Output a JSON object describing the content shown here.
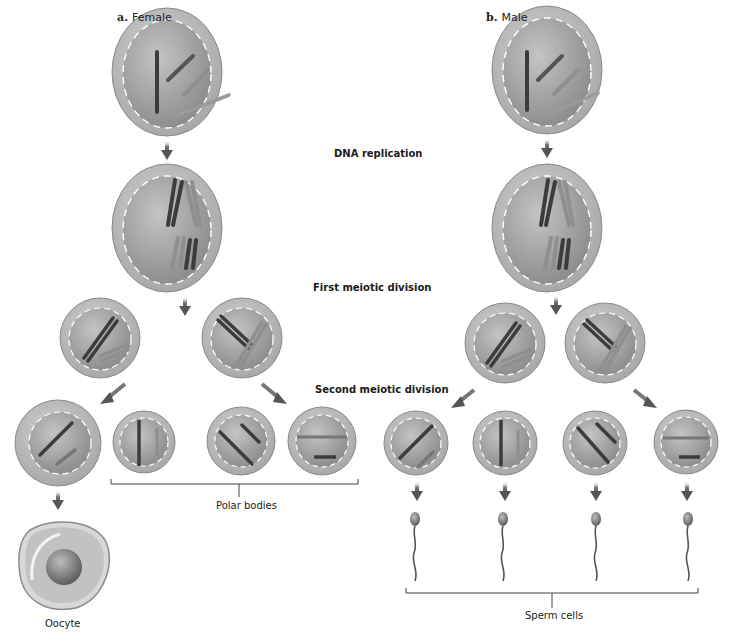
{
  "panels": {
    "female": {
      "letter": "a.",
      "title": "Female"
    },
    "male": {
      "letter": "b.",
      "title": "Male"
    }
  },
  "steps": {
    "dna_replication": "DNA replication",
    "first_meiotic_division": "First meiotic division",
    "second_meiotic_division": "Second meiotic division"
  },
  "groups": {
    "polar_bodies": "Polar bodies",
    "oocyte": "Oocyte",
    "sperm_cells": "Sperm cells"
  },
  "colors": {
    "cell_outer": "#b9b9b9",
    "cell_inner": "#a3a3a3",
    "chromosome_dark": "#3c3c3c",
    "chromosome_mid": "#6e6e6e",
    "chromosome_light": "#8f8f8f",
    "arrow": "#555555"
  },
  "structure": {
    "female": {
      "stage1_cells": 1,
      "stage2_cells": 1,
      "stage3_cells": 2,
      "stage4_cells": 4,
      "final": "1 oocyte + 3 polar bodies"
    },
    "male": {
      "stage1_cells": 1,
      "stage2_cells": 1,
      "stage3_cells": 2,
      "stage4_cells": 4,
      "final": "4 sperm cells"
    }
  }
}
